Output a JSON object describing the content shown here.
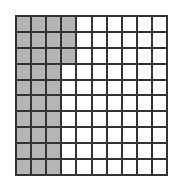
{
  "grid": {
    "rows": 10,
    "cols": 10,
    "shaded_count": 33,
    "total": 100,
    "shaded_full_columns": 3,
    "partial_column_shaded_rows": 3,
    "shade_color": "#b5b5b5",
    "line_color": "#333333"
  }
}
